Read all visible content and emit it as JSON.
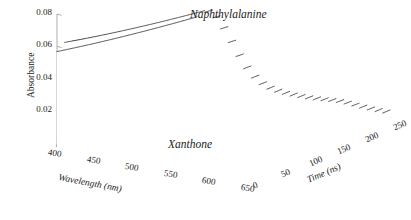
{
  "figure": {
    "kind": "3d-waterfall-surface-plot",
    "background": "#ffffff",
    "line_color": "#1a1a1a",
    "axis_color": "#8a8a8a"
  },
  "axes": {
    "z": {
      "name": "Absorbance",
      "ticks": [
        "0.02",
        "0.04",
        "0.06",
        "0.08"
      ],
      "tick_values": [
        0.02,
        0.04,
        0.06,
        0.08
      ],
      "range": [
        0.0,
        0.08
      ]
    },
    "x": {
      "name": "Wavelength (nm)",
      "ticks": [
        "400",
        "450",
        "500",
        "550",
        "600",
        "650"
      ],
      "tick_values": [
        400,
        450,
        500,
        550,
        600,
        650
      ],
      "range": [
        400,
        650
      ]
    },
    "y": {
      "name": "Time (ns)",
      "ticks": [
        "0",
        "50",
        "100",
        "150",
        "200",
        "250"
      ],
      "tick_values": [
        0,
        50,
        100,
        150,
        200,
        250
      ],
      "range": [
        0,
        250
      ]
    }
  },
  "annotations": [
    {
      "name": "naphthylalanine-label",
      "text": "Naphthylalanine"
    },
    {
      "name": "xanthone-label",
      "text": "Xanthone"
    }
  ],
  "chart_data": {
    "type": "line",
    "title": "",
    "xlabel": "Wavelength (nm)",
    "ylabel": "Time (ns)",
    "zlabel": "Absorbance",
    "xlim": [
      400,
      650
    ],
    "ylim": [
      0,
      250
    ],
    "zlim": [
      0,
      0.08
    ],
    "grid": false,
    "legend": "none",
    "n_traces": 26,
    "trace_axis": "time",
    "stack_axis": "wavelength",
    "surface_model": {
      "components": [
        {
          "name": "naphthylalanine",
          "peak_wavelength": 418,
          "width_nm": 46,
          "amplitude_0": 0.0585,
          "lifetime_ns": 560,
          "baseline_frac": 0.22
        },
        {
          "name": "xanthone",
          "peak_wavelength": 592,
          "width_nm": 27,
          "amplitude_0": 0.03,
          "lifetime_ns": 66,
          "baseline_frac": 0.02
        }
      ],
      "offset": 0.0065,
      "offset_decay_ns": 900
    }
  }
}
